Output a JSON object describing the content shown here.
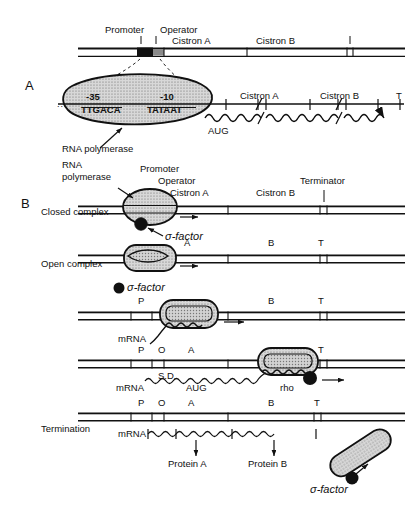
{
  "figure": {
    "panels": [
      {
        "id": "A",
        "label": "A"
      },
      {
        "id": "B",
        "label": "B"
      }
    ]
  },
  "panelA": {
    "panel_label": "A",
    "top_map": {
      "promoter": "Promoter",
      "operator": "Operator",
      "cistron_a": "Cistron A",
      "cistron_b": "Cistron B"
    },
    "expanded": {
      "minus35_label": "-35",
      "minus35_seq": "TTGACA",
      "minus10_label": "-10",
      "minus10_seq": "TATAAT",
      "ellipsis": "...",
      "cistron_a": "Cistron A",
      "cistron_b": "Cistron B",
      "terminator": "T",
      "start_codon": "AUG",
      "polymerase": "RNA polymerase"
    }
  },
  "panelB": {
    "panel_label": "B",
    "polymerase_label_line1": "RNA",
    "polymerase_label_line2": "polymerase",
    "rows": [
      {
        "name": "closed-complex",
        "state": "Closed complex",
        "site_labels": [
          "Promoter",
          "Operator",
          "Cistron A",
          "Cistron B",
          "Terminator"
        ],
        "sigma": "σ-factor"
      },
      {
        "name": "open-complex",
        "state": "Open complex",
        "site_labels": [
          "A",
          "B",
          "T"
        ],
        "sigma": "σ-factor"
      },
      {
        "name": "elongation-early",
        "state": "",
        "site_labels": [
          "P",
          "B",
          "T"
        ],
        "mrna": "mRNA"
      },
      {
        "name": "elongation-late",
        "state": "",
        "site_labels": [
          "P",
          "O",
          "A",
          "T"
        ],
        "mrna": "mRNA",
        "sd": "S.D.",
        "start_codon": "AUG",
        "rho": "rho"
      },
      {
        "name": "termination",
        "state": "Termination",
        "site_labels": [
          "P",
          "O",
          "A",
          "B",
          "T"
        ],
        "mrna": "mRNA",
        "protein_a": "Protein A",
        "protein_b": "Protein B",
        "sigma": "σ-factor"
      }
    ]
  },
  "colors": {
    "ink": "#111111",
    "promoter_box": "#111111",
    "operator_box": "#8a8a8a",
    "polymerase_fill": "#cfcfcf",
    "background": "#ffffff"
  }
}
